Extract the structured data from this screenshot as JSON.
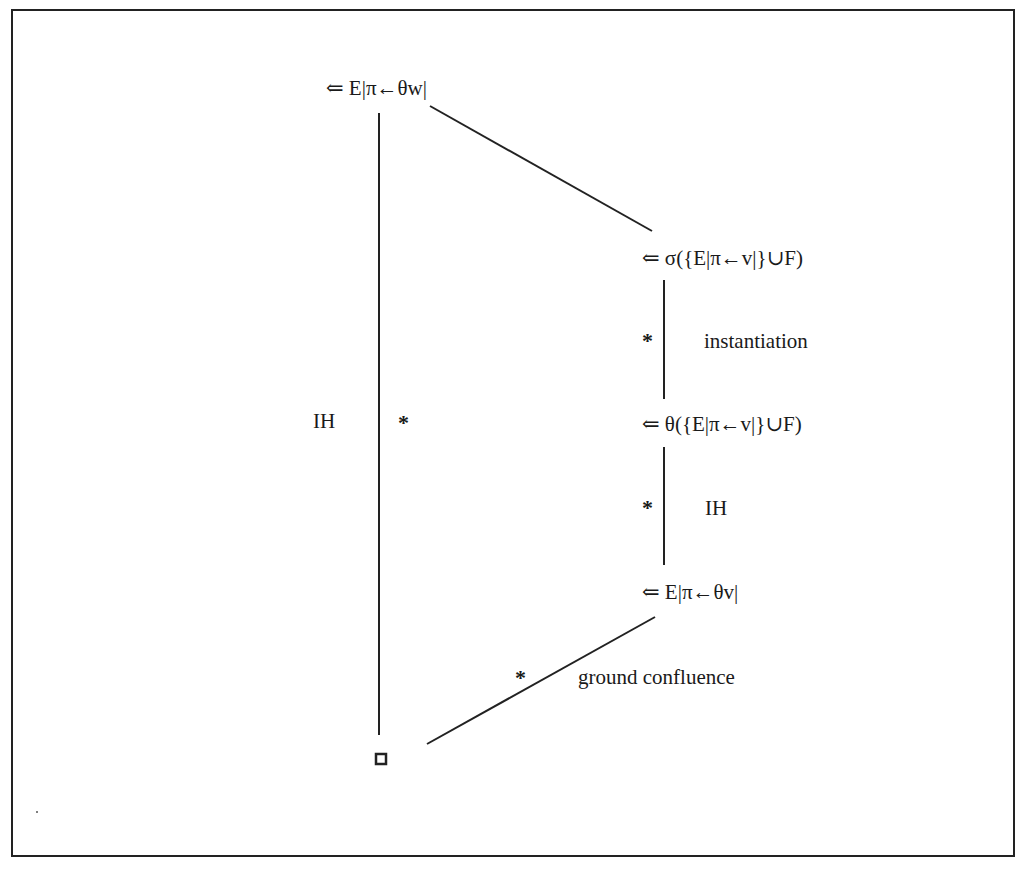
{
  "diagram": {
    "nodes": {
      "top": "⇐ E|π←θw|",
      "sigma": "⇐ σ({E|π←v|}∪F)",
      "theta": "⇐ θ({E|π←v|}∪F)",
      "ev": "⇐ E|π←θv|",
      "bottom": "◘"
    },
    "edge_labels": {
      "left_vertical": "IH",
      "left_vertical_star": "*",
      "right_upper_star": "*",
      "right_upper": "instantiation",
      "right_lower_star": "*",
      "right_lower": "IH",
      "bottom_diagonal_star": "*",
      "bottom_diagonal": "ground confluence"
    }
  }
}
